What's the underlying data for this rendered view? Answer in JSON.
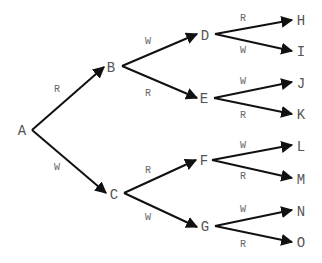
{
  "diagram": {
    "type": "probability-tree",
    "colors": {
      "edge": "#111111",
      "node_text": "#555555",
      "edge_text": "#666666",
      "background": "#ffffff"
    },
    "nodes": [
      {
        "id": "A",
        "label": "A",
        "x": 22,
        "y": 135
      },
      {
        "id": "B",
        "label": "B",
        "x": 111,
        "y": 72
      },
      {
        "id": "C",
        "label": "C",
        "x": 114,
        "y": 199
      },
      {
        "id": "D",
        "label": "D",
        "x": 205,
        "y": 40
      },
      {
        "id": "E",
        "label": "E",
        "x": 204,
        "y": 103
      },
      {
        "id": "F",
        "label": "F",
        "x": 204,
        "y": 165
      },
      {
        "id": "G",
        "label": "G",
        "x": 205,
        "y": 231
      },
      {
        "id": "H",
        "label": "H",
        "x": 301,
        "y": 25
      },
      {
        "id": "I",
        "label": "I",
        "x": 301,
        "y": 56
      },
      {
        "id": "J",
        "label": "J",
        "x": 301,
        "y": 88
      },
      {
        "id": "K",
        "label": "K",
        "x": 301,
        "y": 119
      },
      {
        "id": "L",
        "label": "L",
        "x": 301,
        "y": 151
      },
      {
        "id": "M",
        "label": "M",
        "x": 301,
        "y": 184
      },
      {
        "id": "N",
        "label": "N",
        "x": 301,
        "y": 216
      },
      {
        "id": "O",
        "label": "O",
        "x": 301,
        "y": 247
      }
    ],
    "edges": [
      {
        "from": "A",
        "to": "B",
        "label": "R",
        "x1": 32,
        "y1": 130,
        "x2": 104,
        "y2": 67,
        "lx": 57,
        "ly": 92
      },
      {
        "from": "A",
        "to": "C",
        "label": "W",
        "x1": 32,
        "y1": 130,
        "x2": 106,
        "y2": 193,
        "lx": 57,
        "ly": 170
      },
      {
        "from": "B",
        "to": "D",
        "label": "W",
        "x1": 122,
        "y1": 66,
        "x2": 197,
        "y2": 34,
        "lx": 148,
        "ly": 44
      },
      {
        "from": "B",
        "to": "E",
        "label": "R",
        "x1": 122,
        "y1": 66,
        "x2": 197,
        "y2": 98,
        "lx": 148,
        "ly": 96
      },
      {
        "from": "C",
        "to": "F",
        "label": "R",
        "x1": 124,
        "y1": 193,
        "x2": 196,
        "y2": 160,
        "lx": 148,
        "ly": 173
      },
      {
        "from": "C",
        "to": "G",
        "label": "W",
        "x1": 124,
        "y1": 193,
        "x2": 197,
        "y2": 227,
        "lx": 148,
        "ly": 220
      },
      {
        "from": "D",
        "to": "H",
        "label": "R",
        "x1": 215,
        "y1": 34,
        "x2": 292,
        "y2": 20,
        "lx": 243,
        "ly": 21
      },
      {
        "from": "D",
        "to": "I",
        "label": "W",
        "x1": 215,
        "y1": 34,
        "x2": 292,
        "y2": 51,
        "lx": 243,
        "ly": 53
      },
      {
        "from": "E",
        "to": "J",
        "label": "W",
        "x1": 214,
        "y1": 98,
        "x2": 292,
        "y2": 82,
        "lx": 243,
        "ly": 84
      },
      {
        "from": "E",
        "to": "K",
        "label": "R",
        "x1": 214,
        "y1": 98,
        "x2": 292,
        "y2": 114,
        "lx": 243,
        "ly": 118
      },
      {
        "from": "F",
        "to": "L",
        "label": "W",
        "x1": 212,
        "y1": 160,
        "x2": 292,
        "y2": 145,
        "lx": 243,
        "ly": 148
      },
      {
        "from": "F",
        "to": "M",
        "label": "R",
        "x1": 212,
        "y1": 160,
        "x2": 292,
        "y2": 178,
        "lx": 243,
        "ly": 179
      },
      {
        "from": "G",
        "to": "N",
        "label": "W",
        "x1": 215,
        "y1": 226,
        "x2": 292,
        "y2": 210,
        "lx": 243,
        "ly": 212
      },
      {
        "from": "G",
        "to": "O",
        "label": "R",
        "x1": 215,
        "y1": 226,
        "x2": 292,
        "y2": 242,
        "lx": 243,
        "ly": 247
      }
    ]
  }
}
